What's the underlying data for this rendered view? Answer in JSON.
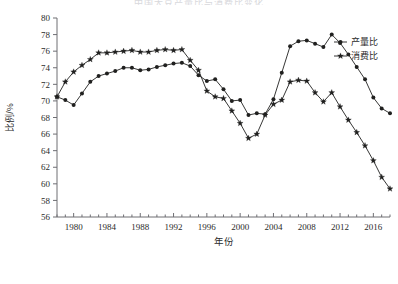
{
  "title": "中国大豆产量比与消费比变化",
  "axes": {
    "ylabel": "比例/%",
    "xlabel": "年份",
    "ytick_labels": [
      "56",
      "58",
      "60",
      "62",
      "64",
      "66",
      "68",
      "70",
      "72",
      "74",
      "76",
      "78",
      "80"
    ],
    "xtick_labels": [
      "1980",
      "1984",
      "1988",
      "1992",
      "1996",
      "2000",
      "2004",
      "2008",
      "2012",
      "2016"
    ]
  },
  "legend": {
    "items": [
      {
        "label": "产量比",
        "marker": "filled-circle",
        "color": "#20201f"
      },
      {
        "label": "消费比",
        "marker": "star",
        "color": "#20201f"
      }
    ]
  },
  "chart_data": {
    "type": "line",
    "title": "中国大豆产量比与消费比变化",
    "xlabel": "年份",
    "ylabel": "比例/%",
    "xlim": [
      1978,
      2018
    ],
    "ylim": [
      56,
      80
    ],
    "ytick_step": 2,
    "xtick_step": 4,
    "grid": false,
    "legend_position": "top-right",
    "x": [
      1978,
      1979,
      1980,
      1981,
      1982,
      1983,
      1984,
      1985,
      1986,
      1987,
      1988,
      1989,
      1990,
      1991,
      1992,
      1993,
      1994,
      1995,
      1996,
      1997,
      1998,
      1999,
      2000,
      2001,
      2002,
      2003,
      2004,
      2005,
      2006,
      2007,
      2008,
      2009,
      2010,
      2011,
      2012,
      2013,
      2014,
      2015,
      2016,
      2017,
      2018
    ],
    "series": [
      {
        "name": "产量比",
        "marker": "filled-circle",
        "color": "#20201f",
        "values": [
          70.5,
          70.1,
          69.5,
          70.9,
          72.3,
          73.0,
          73.3,
          73.6,
          74.0,
          74.0,
          73.7,
          73.8,
          74.1,
          74.3,
          74.5,
          74.6,
          74.2,
          73.1,
          72.4,
          72.6,
          71.4,
          70.0,
          70.1,
          68.3,
          68.5,
          68.4,
          70.2,
          73.4,
          76.6,
          77.2,
          77.3,
          76.9,
          76.5,
          78.0,
          77.0,
          75.6,
          74.1,
          72.6,
          70.4,
          69.1,
          68.5
        ]
      },
      {
        "name": "消费比",
        "marker": "star",
        "color": "#20201f",
        "values": [
          70.5,
          72.3,
          73.5,
          74.3,
          75.0,
          75.8,
          75.8,
          75.9,
          76.0,
          76.1,
          75.9,
          75.9,
          76.1,
          76.2,
          76.1,
          76.2,
          74.9,
          73.7,
          71.2,
          70.5,
          70.3,
          68.8,
          67.3,
          65.5,
          66.0,
          68.3,
          69.6,
          70.1,
          72.3,
          72.5,
          72.4,
          71.0,
          69.9,
          71.0,
          69.3,
          67.7,
          66.2,
          64.6,
          62.8,
          60.8,
          59.4
        ]
      }
    ]
  }
}
